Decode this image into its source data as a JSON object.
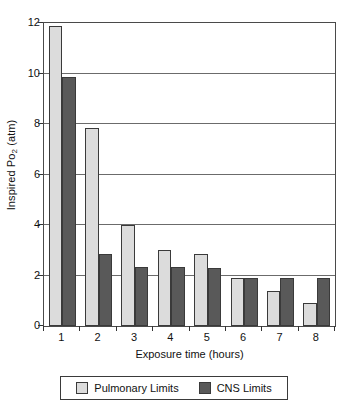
{
  "chart_data": {
    "type": "bar",
    "title": "",
    "xlabel": "Exposure time (hours)",
    "ylabel": "Inspired Po2 (atm)",
    "ylabel_base": "Inspired Po",
    "ylabel_sub": "2",
    "ylabel_unit": " (atm)",
    "categories": [
      "1",
      "2",
      "3",
      "4",
      "5",
      "6",
      "7",
      "8"
    ],
    "series": [
      {
        "name": "Pulmonary Limits",
        "color": "#dcdcdc",
        "values": [
          11.9,
          7.85,
          4.0,
          3.0,
          2.85,
          1.9,
          1.4,
          0.9
        ]
      },
      {
        "name": "CNS Limits",
        "color": "#595959",
        "values": [
          9.85,
          2.85,
          2.35,
          2.35,
          2.3,
          1.9,
          1.9,
          1.9
        ]
      }
    ],
    "ylim": [
      0,
      12
    ],
    "yticks": [
      0,
      2,
      4,
      6,
      8,
      10,
      12
    ],
    "ytick_labels": [
      "0",
      "2",
      "4",
      "6",
      "8",
      "10",
      "12"
    ],
    "grid": true,
    "grid_axis": "y",
    "legend_position": "bottom"
  },
  "legend": {
    "entries": [
      {
        "label": "Pulmonary Limits",
        "swatch": "pulmonary-swatch"
      },
      {
        "label": "CNS Limits",
        "swatch": "cns-swatch"
      }
    ]
  },
  "axes": {
    "x_title": "Exposure time (hours)",
    "y_title_base": "Inspired Po",
    "y_title_sub": "2",
    "y_title_unit": " (atm)"
  }
}
